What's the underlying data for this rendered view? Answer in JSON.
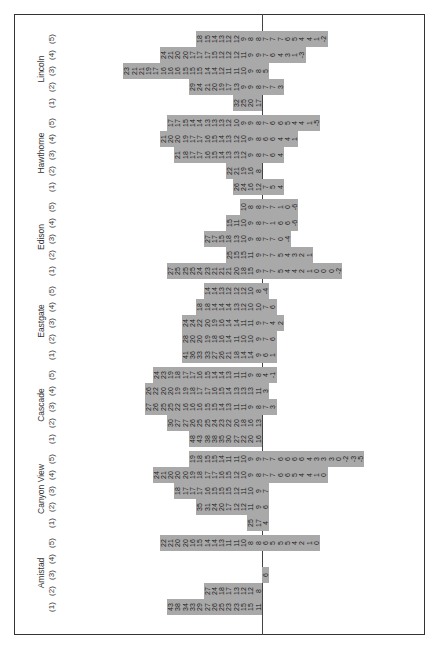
{
  "chart_data": {
    "type": "table",
    "title": "",
    "column_labels": [
      "(1)",
      "(2)",
      "(3)",
      "(4)",
      "(5)"
    ],
    "baseline_between": "upper values (>=8 region) and lower values",
    "schools": [
      {
        "name": "Amistad",
        "columns": [
          [
            "43",
            "38",
            "34",
            "33",
            "29",
            "27",
            "26",
            "25",
            "23",
            "23",
            "15",
            "15",
            "11"
          ],
          [
            "27",
            "24",
            "18",
            "17",
            "13",
            "12",
            "12",
            "8"
          ],
          [
            "6"
          ],
          [],
          [
            "22",
            "21",
            "20",
            "20",
            "16",
            "15",
            "14",
            "14",
            "13",
            "11",
            "11",
            "10",
            "8",
            "8",
            "6",
            "5",
            "5",
            "5",
            "4",
            "2",
            "1",
            "0"
          ]
        ]
      },
      {
        "name": "Canyon View",
        "columns": [
          [
            "25",
            "17",
            "4"
          ],
          [
            "35",
            "31",
            "24",
            "20",
            "17",
            "12",
            "12",
            "11",
            "9",
            "6"
          ],
          [
            "18",
            "17",
            "17",
            "17",
            "16",
            "15",
            "15",
            "15",
            "12",
            "11",
            "10",
            "9",
            "7"
          ],
          [
            "24",
            "21",
            "20",
            "20",
            "20",
            "19",
            "18",
            "17",
            "17",
            "16",
            "15",
            "12",
            "10",
            "9",
            "8",
            "7",
            "7",
            "6",
            "6",
            "5",
            "4",
            "4",
            "1",
            "0"
          ],
          [
            "19",
            "18",
            "15",
            "15",
            "14",
            "11",
            "11",
            "10",
            "9",
            "9",
            "7",
            "7",
            "6",
            "6",
            "6",
            "6",
            "4",
            "3",
            "3",
            "3",
            "0",
            "-2",
            "-3",
            "-5"
          ]
        ]
      },
      {
        "name": "Cascade",
        "columns": [
          [
            "48",
            "43",
            "38",
            "38",
            "35",
            "30",
            "27",
            "22",
            "20",
            "16"
          ],
          [
            "30",
            "27",
            "27",
            "26",
            "25",
            "25",
            "24",
            "23",
            "22",
            "20",
            "18",
            "16",
            "13"
          ],
          [
            "27",
            "26",
            "25",
            "25",
            "22",
            "16",
            "16",
            "16",
            "15",
            "15",
            "14",
            "13",
            "11",
            "11",
            "9",
            "8",
            "7",
            "3"
          ],
          [
            "26",
            "22",
            "20",
            "20",
            "19",
            "19",
            "18",
            "17",
            "17",
            "16",
            "15",
            "14",
            "13",
            "13",
            "13",
            "11",
            "3"
          ],
          [
            "24",
            "23",
            "19",
            "18",
            "17",
            "17",
            "16",
            "15",
            "14",
            "14",
            "13",
            "11",
            "11",
            "9",
            "8",
            "4",
            "-1"
          ]
        ]
      },
      {
        "name": "Eastgate",
        "columns": [
          [
            "41",
            "36",
            "33",
            "33",
            "27",
            "26",
            "21",
            "18",
            "14",
            "14",
            "9",
            "6",
            "1"
          ],
          [
            "28",
            "20",
            "20",
            "19",
            "18",
            "16",
            "14",
            "11",
            "10",
            "10",
            "9",
            "7",
            "6"
          ],
          [
            "24",
            "24",
            "22",
            "20",
            "19",
            "16",
            "14",
            "14",
            "11",
            "11",
            "9",
            "7",
            "4",
            "2"
          ],
          [
            "18",
            "18",
            "14",
            "14",
            "14",
            "13",
            "12",
            "10",
            "10",
            "7",
            "6"
          ],
          [
            "14",
            "14",
            "13",
            "12",
            "12",
            "12",
            "10",
            "8",
            "-4"
          ]
        ]
      },
      {
        "name": "Edison",
        "columns": [
          [
            "27",
            "25",
            "25",
            "25",
            "24",
            "23",
            "21",
            "21",
            "21",
            "20",
            "18",
            "15",
            "9",
            "7",
            "7",
            "5",
            "4",
            "4",
            "2",
            "1",
            "0",
            "0",
            "0",
            "-2"
          ],
          [
            "25",
            "15",
            "15",
            "11",
            "9",
            "7",
            "7",
            "5",
            "4",
            "3",
            "2",
            "1"
          ],
          [
            "27",
            "17",
            "15",
            "18",
            "13",
            "10",
            "9",
            "8",
            "7",
            "7",
            "0",
            "-4"
          ],
          [
            "15",
            "11",
            "10",
            "9",
            "8",
            "7",
            "1",
            "6",
            "6",
            "-6"
          ],
          [
            "10",
            "8",
            "8",
            "7",
            "7",
            "1",
            "0",
            "-6"
          ]
        ]
      },
      {
        "name": "Hawthorne",
        "columns": [
          [
            "26",
            "24",
            "16",
            "12",
            "7",
            "5",
            "4"
          ],
          [
            "22",
            "21",
            "19",
            "16",
            "8"
          ],
          [
            "21",
            "18",
            "17",
            "17",
            "16",
            "15",
            "14",
            "13",
            "13",
            "12",
            "9",
            "8",
            "7",
            "6",
            "4"
          ],
          [
            "21",
            "20",
            "20",
            "19",
            "17",
            "17",
            "16",
            "15",
            "14",
            "13",
            "12",
            "10",
            "9",
            "8",
            "6",
            "6",
            "4",
            "4",
            "1"
          ],
          [
            "17",
            "17",
            "15",
            "14",
            "14",
            "13",
            "13",
            "13",
            "12",
            "10",
            "9",
            "9",
            "8",
            "7",
            "6",
            "6",
            "5",
            "4",
            "4",
            "1",
            "-5"
          ]
        ]
      },
      {
        "name": "Lincoln",
        "columns": [
          [
            "32",
            "25",
            "20",
            "17"
          ],
          [
            "29",
            "24",
            "21",
            "20",
            "19",
            "17",
            "13",
            "9",
            "9",
            "8",
            "7",
            "7",
            "3"
          ],
          [
            "23",
            "21",
            "21",
            "19",
            "17",
            "16",
            "16",
            "16",
            "15",
            "15",
            "15",
            "14",
            "14",
            "12",
            "11",
            "11",
            "10",
            "9",
            "8",
            "5"
          ],
          [
            "24",
            "21",
            "20",
            "20",
            "17",
            "17",
            "17",
            "15",
            "12",
            "12",
            "12",
            "11",
            "9",
            "9",
            "7",
            "6",
            "4",
            "3",
            "1",
            "-3"
          ],
          [
            "18",
            "15",
            "14",
            "13",
            "12",
            "12",
            "9",
            "8",
            "8",
            "7",
            "7",
            "7",
            "6",
            "5",
            "4",
            "4",
            "1",
            "-2"
          ]
        ]
      }
    ]
  }
}
